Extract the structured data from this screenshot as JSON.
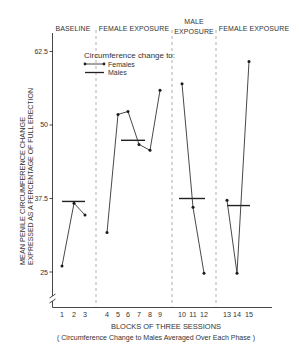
{
  "chart_data": {
    "type": "line",
    "title": "",
    "xlabel": "BLOCKS OF THREE SESSIONS",
    "xlabel_note": "( Circumference Change to Males Averaged Over Each Phase )",
    "ylabel_line1": "MEAN PENILE CIRCUMFERENCE CHANGE",
    "ylabel_line2": "EXPRESSED AS A PERCENTAGE OF FULL ERECTION",
    "x": [
      1,
      2,
      3,
      4,
      5,
      6,
      7,
      8,
      9,
      10,
      11,
      12,
      13,
      14,
      15
    ],
    "x_tick_labels": [
      "1",
      "2",
      "3",
      "4",
      "5",
      "6",
      "7",
      "8",
      "9",
      "10",
      "11",
      "12",
      "13",
      "14",
      "15"
    ],
    "yticks": [
      25,
      37.5,
      50,
      62.5
    ],
    "ytick_labels": [
      "25",
      "37.5",
      "50",
      "62.5"
    ],
    "ylim": [
      19,
      65.5
    ],
    "y_axis_break": true,
    "grid": false,
    "phases": [
      {
        "label": "BASELINE",
        "label_line2": "",
        "blocks": [
          1,
          3
        ]
      },
      {
        "label": "FEMALE EXPOSURE",
        "label_line2": "",
        "blocks": [
          4,
          9
        ]
      },
      {
        "label": "MALE",
        "label_line2": "EXPOSURE",
        "blocks": [
          10,
          12
        ]
      },
      {
        "label": "FEMALE EXPOSURE",
        "label_line2": "",
        "blocks": [
          13,
          15
        ]
      }
    ],
    "series": [
      {
        "name": "Females",
        "style": "line-with-dots",
        "values": [
          26,
          36.7,
          34.7,
          31.7,
          51.8,
          52.3,
          46.7,
          45.7,
          55.9,
          57,
          36,
          24.8,
          37.2,
          24.8,
          60.8
        ]
      },
      {
        "name": "Males",
        "style": "phase-mean-bar",
        "phase_means": [
          37,
          47.4,
          37.5,
          36.3
        ]
      }
    ],
    "legend": {
      "title": "Circumference change to:",
      "entries": [
        "Females",
        "Males"
      ],
      "position": "upper-left inside plot"
    },
    "colors": {
      "line": "#333333",
      "divider": "#a8a8a8",
      "text": "#333333"
    }
  }
}
